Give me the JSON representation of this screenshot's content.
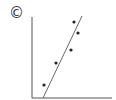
{
  "panel": {
    "label": "©",
    "label_meaning": "panel C",
    "colors": {
      "axis": "#555555",
      "line": "#666666",
      "points": "#222222"
    }
  },
  "chart_data": {
    "type": "scatter",
    "title": "",
    "xlabel": "",
    "ylabel": "",
    "grid": false,
    "legend": false,
    "points_px": [
      {
        "x": 44,
        "y": 85
      },
      {
        "x": 56,
        "y": 63
      },
      {
        "x": 71,
        "y": 50
      },
      {
        "x": 74,
        "y": 22
      },
      {
        "x": 78,
        "y": 33
      }
    ],
    "points_relative": [
      {
        "x": 0.15,
        "y": 0.16
      },
      {
        "x": 0.3,
        "y": 0.43
      },
      {
        "x": 0.49,
        "y": 0.59
      },
      {
        "x": 0.53,
        "y": 0.94
      },
      {
        "x": 0.58,
        "y": 0.8
      }
    ],
    "trendline": {
      "type": "linear",
      "from": {
        "x": 0.14,
        "y": 0.0
      },
      "to": {
        "x": 0.63,
        "y": 1.0
      },
      "slope": "positive, steep"
    }
  }
}
